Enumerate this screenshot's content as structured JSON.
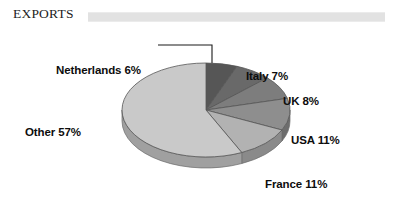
{
  "header": {
    "title": "EXPORTS",
    "rule_color": "#e2e2e2"
  },
  "chart_data": {
    "type": "pie",
    "title": "EXPORTS",
    "subtitle": "",
    "xlabel": "",
    "ylabel": "",
    "grid": false,
    "legend_position": "none",
    "units": "percent",
    "value_suffix": "%",
    "start_angle_deg": 0,
    "direction": "clockwise",
    "three_d": true,
    "categories": [
      "Netherlands",
      "Italy",
      "UK",
      "USA",
      "France",
      "Other"
    ],
    "values": [
      6,
      7,
      8,
      11,
      11,
      57
    ],
    "labels": [
      "Netherlands 6%",
      "Italy 7%",
      "UK 8%",
      "USA 11%",
      "France 11%",
      "Other 57%"
    ],
    "colors": [
      "#565656",
      "#696969",
      "#7d7d7d",
      "#8e8e8e",
      "#b2b2b2",
      "#c9c9c9"
    ],
    "slices": [
      {
        "name": "Netherlands",
        "value": 6,
        "label": "Netherlands 6%",
        "color": "#565656",
        "side_color": "#3f3f3f",
        "leader_line": true
      },
      {
        "name": "Italy",
        "value": 7,
        "label": "Italy 7%",
        "color": "#696969",
        "side_color": "#4e4e4e",
        "leader_line": false
      },
      {
        "name": "UK",
        "value": 8,
        "label": "UK 8%",
        "color": "#7d7d7d",
        "side_color": "#5f5f5f",
        "leader_line": false
      },
      {
        "name": "USA",
        "value": 11,
        "label": "USA 11%",
        "color": "#8e8e8e",
        "side_color": "#6d6d6d",
        "leader_line": false
      },
      {
        "name": "France",
        "value": 11,
        "label": "France 11%",
        "color": "#b2b2b2",
        "side_color": "#8a8a8a",
        "leader_line": false
      },
      {
        "name": "Other",
        "value": 57,
        "label": "Other 57%",
        "color": "#c9c9c9",
        "side_color": "#a0a0a0",
        "leader_line": false
      }
    ],
    "total": 100
  }
}
